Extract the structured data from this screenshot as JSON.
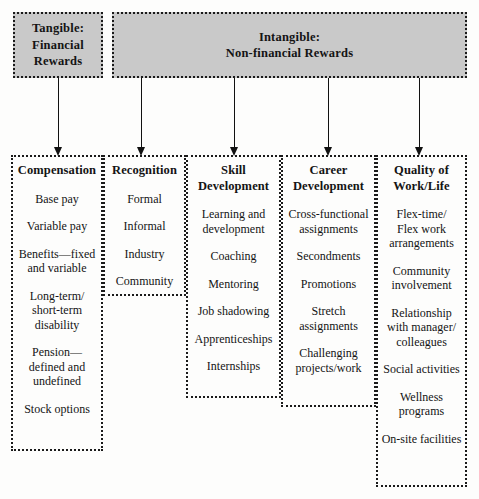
{
  "diagram": {
    "top_boxes": [
      {
        "id": "tangible",
        "label": "Tangible:\nFinancial\nRewards",
        "fill_color": "#c9c9c9"
      },
      {
        "id": "intangible",
        "label": "Intangible:\nNon-financial Rewards",
        "fill_color": "#c9c9c9"
      }
    ],
    "columns": [
      {
        "id": "compensation",
        "title": "Compensation",
        "items": [
          "Base pay",
          "Variable pay",
          "Benefits—fixed\nand variable",
          "Long-term/\nshort-term\ndisability",
          "Pension—\ndefined and\nundefined",
          "Stock options"
        ]
      },
      {
        "id": "recognition",
        "title": "Recognition",
        "items": [
          "Formal",
          "Informal",
          "Industry",
          "Community"
        ]
      },
      {
        "id": "skill",
        "title": "Skill\nDevelopment",
        "items": [
          "Learning and\ndevelopment",
          "Coaching",
          "Mentoring",
          "Job shadowing",
          "Apprenticeships",
          "Internships"
        ]
      },
      {
        "id": "career",
        "title": "Career\nDevelopment",
        "items": [
          "Cross-functional\nassignments",
          "Secondments",
          "Promotions",
          "Stretch\nassignments",
          "Challenging\nprojects/work"
        ]
      },
      {
        "id": "quality",
        "title": "Quality of\nWork/Life",
        "items": [
          "Flex-time/\nFlex work\narrangements",
          "Community\ninvolvement",
          "Relationship\nwith manager/\ncolleagues",
          "Social activities",
          "Wellness\nprograms",
          "On-site facilities"
        ]
      }
    ],
    "connectors": [
      {
        "id": "arrow-to-compensation",
        "from": "tangible",
        "to": "compensation"
      },
      {
        "id": "arrow-to-recognition",
        "from": "intangible",
        "to": "recognition"
      },
      {
        "id": "arrow-to-skill",
        "from": "intangible",
        "to": "skill"
      },
      {
        "id": "arrow-to-career",
        "from": "intangible",
        "to": "career"
      },
      {
        "id": "arrow-to-quality",
        "from": "intangible",
        "to": "quality"
      }
    ],
    "colors": {
      "box_fill": "#c9c9c9",
      "border": "#1a1a1a",
      "text": "#141414",
      "background": "#fdfdfc"
    }
  }
}
